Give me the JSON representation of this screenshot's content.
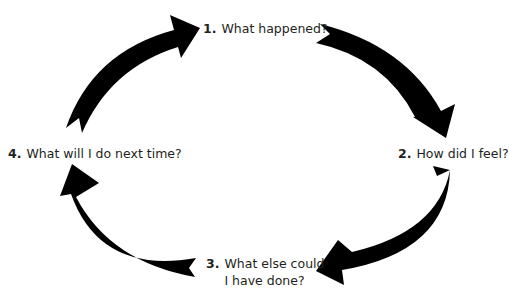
{
  "diagram": {
    "type": "cycle",
    "arrow_color": "#000000",
    "text_color": "#231f20",
    "steps": [
      {
        "number": "1.",
        "label": "What happened?"
      },
      {
        "number": "2.",
        "label": "How did I feel?"
      },
      {
        "number": "3.",
        "label": "What else could I have done?"
      },
      {
        "number": "4.",
        "label": "What will I do next time?"
      }
    ],
    "arrows": [
      {
        "from": "4",
        "to": "1",
        "direction": "clockwise"
      },
      {
        "from": "1",
        "to": "2",
        "direction": "clockwise"
      },
      {
        "from": "2",
        "to": "3",
        "direction": "clockwise"
      },
      {
        "from": "3",
        "to": "4",
        "direction": "clockwise"
      }
    ]
  }
}
